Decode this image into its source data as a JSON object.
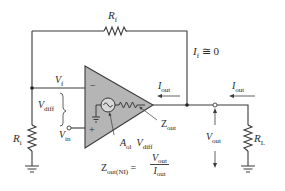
{
  "diagram": {
    "colors": {
      "wire": "#3a3a3a",
      "opamp_fill": "#b5b5b5",
      "text": "#2a2a2a",
      "background": "#ffffff"
    },
    "labels": {
      "rf": {
        "main": "R",
        "sub": "f"
      },
      "if_eq": {
        "main": "I",
        "sub": "f",
        "rest": " ≅ 0"
      },
      "vf": {
        "main": "V",
        "sub": "f"
      },
      "vdiff": {
        "main": "V",
        "sub": "diff"
      },
      "vin": {
        "main": "V",
        "sub": "in"
      },
      "ri": {
        "main": "R",
        "sub": "i"
      },
      "iout_inner": {
        "main": "I",
        "sub": "out"
      },
      "iout_outer": {
        "main": "I",
        "sub": "out"
      },
      "zout": {
        "main": "Z",
        "sub": "out"
      },
      "vout": {
        "main": "V",
        "sub": "out"
      },
      "rl": {
        "main": "R",
        "sub": "L"
      },
      "aol_vdiff": {
        "a_main": "A",
        "a_sub": "ol",
        "v_main": "V",
        "v_sub": "diff"
      },
      "minus_sign": "−",
      "plus_sign": "+"
    },
    "formula": {
      "lhs_main": "Z",
      "lhs_sub": "out(NI)",
      "equals": "=",
      "numerator_main": "V",
      "numerator_sub": "out",
      "denominator_main": "I",
      "denominator_sub": "out"
    },
    "icons": [
      "resistor-icon",
      "ground-icon",
      "ac-source-icon",
      "arrow-icon",
      "node-dot-icon",
      "terminal-circle-icon"
    ]
  }
}
